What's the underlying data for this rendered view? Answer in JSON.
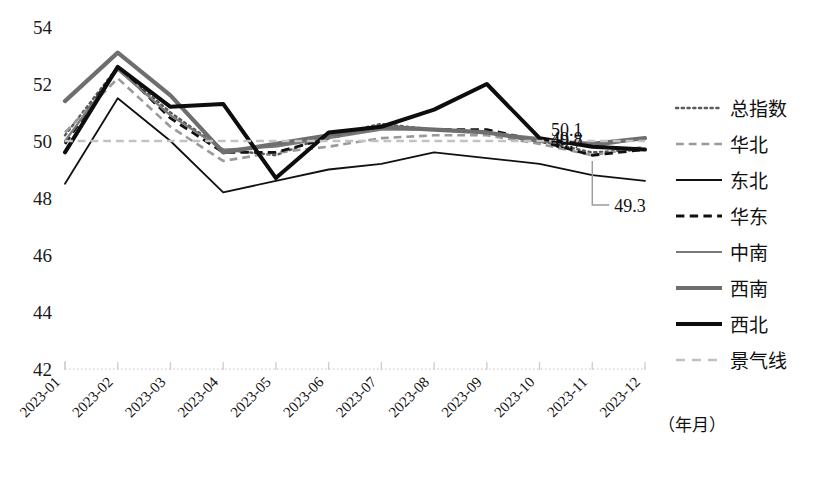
{
  "chart_data": {
    "type": "line",
    "title": "",
    "xlabel": "（年月）",
    "ylabel": "",
    "ylim": [
      42,
      54
    ],
    "yticks": [
      42,
      44,
      46,
      48,
      50,
      52,
      54
    ],
    "grid": false,
    "legend_position": "right",
    "categories": [
      "2023-01",
      "2023-02",
      "2023-03",
      "2023-04",
      "2023-05",
      "2023-06",
      "2023-07",
      "2023-08",
      "2023-09",
      "2023-10",
      "2023-11",
      "2023-12"
    ],
    "series": [
      {
        "name": "总指数",
        "style": "dotted",
        "color": "#5a5a5a",
        "width": 2.4,
        "values": [
          50.2,
          52.6,
          51.0,
          49.7,
          49.5,
          50.2,
          50.6,
          50.4,
          50.3,
          50.0,
          49.6,
          49.7
        ]
      },
      {
        "name": "华北",
        "style": "dashed",
        "color": "#9a9a9a",
        "width": 2.6,
        "values": [
          50.3,
          52.2,
          50.5,
          49.3,
          49.6,
          49.8,
          50.1,
          50.2,
          50.2,
          49.9,
          49.5,
          49.8
        ]
      },
      {
        "name": "东北",
        "style": "solid",
        "color": "#111111",
        "width": 1.8,
        "values": [
          48.5,
          51.5,
          50.0,
          48.2,
          48.6,
          49.0,
          49.2,
          49.6,
          49.4,
          49.2,
          48.8,
          48.6
        ]
      },
      {
        "name": "华东",
        "style": "dashed",
        "color": "#111111",
        "width": 2.8,
        "values": [
          49.9,
          52.6,
          50.8,
          49.6,
          49.6,
          50.1,
          50.5,
          50.4,
          50.4,
          50.0,
          49.5,
          49.7
        ]
      },
      {
        "name": "中南",
        "style": "solid",
        "color": "#7a7a7a",
        "width": 2.2,
        "values": [
          50.0,
          52.5,
          50.9,
          49.7,
          49.8,
          50.1,
          50.4,
          50.4,
          50.3,
          50.1,
          49.8,
          50.1
        ]
      },
      {
        "name": "西南",
        "style": "solid",
        "color": "#6e6e6e",
        "width": 4.2,
        "values": [
          51.4,
          53.1,
          51.6,
          49.6,
          49.9,
          50.2,
          50.5,
          50.4,
          50.3,
          50.0,
          49.9,
          50.1
        ]
      },
      {
        "name": "西北",
        "style": "solid",
        "color": "#0d0d0d",
        "width": 4.0,
        "values": [
          49.6,
          52.6,
          51.2,
          51.3,
          48.7,
          50.3,
          50.5,
          51.1,
          52.0,
          50.1,
          49.8,
          49.7
        ]
      },
      {
        "name": "景气线",
        "style": "dashed",
        "color": "#c2c2c2",
        "width": 2.6,
        "values": [
          50,
          50,
          50,
          50,
          50,
          50,
          50,
          50,
          50,
          50,
          50,
          50
        ]
      }
    ],
    "annotations": [
      {
        "text": "50.1",
        "x": 12,
        "y": 50.1
      },
      {
        "text": "49.8",
        "x": 12,
        "y": 49.8
      },
      {
        "text": "49.7",
        "x": 12,
        "y": 49.7
      },
      {
        "text": "49.3",
        "x": 11,
        "y": 49.3,
        "leader": true
      }
    ]
  },
  "legend": {
    "items": [
      {
        "label": "总指数"
      },
      {
        "label": "华北"
      },
      {
        "label": "东北"
      },
      {
        "label": "华东"
      },
      {
        "label": "中南"
      },
      {
        "label": "西南"
      },
      {
        "label": "西北"
      },
      {
        "label": "景气线"
      }
    ]
  }
}
